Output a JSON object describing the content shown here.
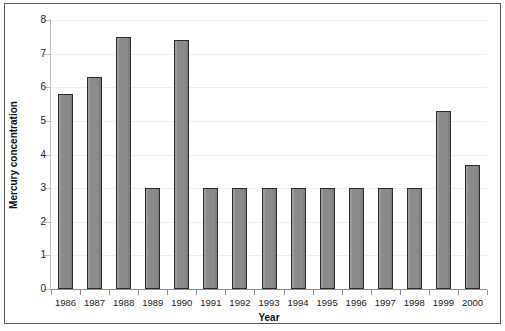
{
  "chart_data": {
    "type": "bar",
    "title": "",
    "subtitle": "",
    "xlabel": "Year",
    "ylabel": "Mercury concentration",
    "categories": [
      "1986",
      "1987",
      "1988",
      "1989",
      "1990",
      "1991",
      "1992",
      "1993",
      "1994",
      "1995",
      "1996",
      "1997",
      "1998",
      "1999",
      "2000"
    ],
    "values": [
      5.8,
      6.3,
      7.5,
      3.0,
      7.4,
      3.0,
      3.0,
      3.0,
      3.0,
      3.0,
      3.0,
      3.0,
      3.0,
      5.3,
      3.7
    ],
    "series": [
      {
        "name": "Mercury concentration",
        "values": [
          5.8,
          6.3,
          7.5,
          3.0,
          7.4,
          3.0,
          3.0,
          3.0,
          3.0,
          3.0,
          3.0,
          3.0,
          3.0,
          5.3,
          3.7
        ]
      }
    ],
    "ylim": [
      0,
      8
    ],
    "yticks": [
      0,
      1,
      2,
      3,
      4,
      5,
      6,
      7,
      8
    ],
    "ytick_labels": [
      "0",
      "1",
      "2",
      "3",
      "4",
      "5",
      "6",
      "7",
      "8"
    ],
    "grid": true,
    "grid_axis": "y",
    "legend": false,
    "legend_position": "none",
    "bar_color": "#8c8c8c",
    "bar_border_color": "#2b2b2b",
    "gridline_color": "#eeeeee",
    "axis_color": "#8f8f8f",
    "frame_color": "#5a5a5a",
    "background": "#ffffff",
    "annotations": []
  }
}
